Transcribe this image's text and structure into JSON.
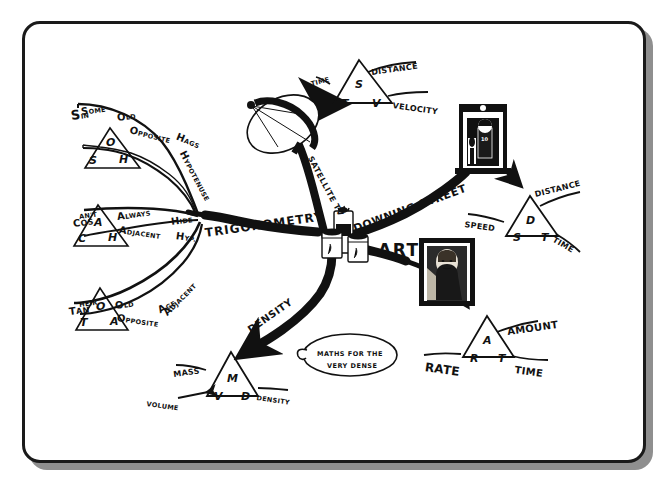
{
  "document": {
    "kind": "hand-drawn-mind-map",
    "title": "Maths Mind Map",
    "frame_color": "#1a1a1a",
    "shadow_color": "#8f8f8f",
    "ink_color": "#111111",
    "paper_color": "#ffffff"
  },
  "center": {
    "label": "ART"
  },
  "branches": {
    "trigonometry": {
      "label": "TRIGONOMETRY"
    },
    "satellite_tv": {
      "label": "SATELLITE TV"
    },
    "downing_street": {
      "label": "DOWNING STREET"
    },
    "density": {
      "label": "DENSITY"
    }
  },
  "mnemonics": [
    {
      "id": "sin",
      "function": "Sin",
      "words": [
        "S",
        "OME",
        "O",
        "LD",
        "O",
        "PPOSITE",
        "H",
        "AGS",
        "H",
        "YPOTENUSE"
      ],
      "phrase_parts": [
        {
          "big": "S",
          "small": "OME"
        },
        {
          "big": "O",
          "small": "LD"
        },
        {
          "big": "O",
          "small": "PPOSITE"
        },
        {
          "big": "H",
          "small": "AGS"
        },
        {
          "big": "H",
          "small": "YPOTENUSE"
        }
      ],
      "func_big": "S",
      "func_small": "IN",
      "triangle": {
        "top": "O",
        "left": "S",
        "right": "H"
      }
    },
    {
      "id": "cos",
      "function": "Cos",
      "phrase_parts": [
        {
          "big": "C",
          "small": "AN'T"
        },
        {
          "big": "A",
          "small": "LWAYS"
        },
        {
          "big": "A",
          "small": "DJACENT"
        },
        {
          "big": "H",
          "small": "IDE"
        },
        {
          "big": "H",
          "small": "YP."
        }
      ],
      "func_big": "C",
      "func_small": "OS",
      "triangle": {
        "top": "A",
        "left": "C",
        "right": "H"
      }
    },
    {
      "id": "tan",
      "function": "Tan",
      "phrase_parts": [
        {
          "big": "T",
          "small": "HEIR"
        },
        {
          "big": "O",
          "small": "LD"
        },
        {
          "big": "O",
          "small": "PPOSITE"
        },
        {
          "big": "A",
          "small": "GE"
        },
        {
          "big": "A",
          "small": "DJACENT"
        }
      ],
      "func_big": "T",
      "func_small": "AN",
      "triangle": {
        "top": "O",
        "left": "T",
        "right": "A"
      }
    }
  ],
  "formula_triangles": [
    {
      "id": "velocity",
      "labels": {
        "top_left": "TIME",
        "top_right": "DISTANCE",
        "right": "VELOCITY"
      },
      "triangle": {
        "top": "S",
        "left": "T",
        "right": "V"
      }
    },
    {
      "id": "speed",
      "labels": {
        "left": "SPEED",
        "top_right": "DISTANCE",
        "bottom_right": "TIME"
      },
      "triangle": {
        "top": "D",
        "left": "S",
        "right": "T"
      }
    },
    {
      "id": "rate",
      "labels": {
        "left": "RATE",
        "top_right": "AMOUNT",
        "bottom_right": "TIME"
      },
      "triangle": {
        "top": "A",
        "left": "R",
        "right": "T"
      }
    },
    {
      "id": "density",
      "labels": {
        "left": "MASS",
        "bottom_left": "VOLUME",
        "right": "DENSITY"
      },
      "triangle": {
        "top": "M",
        "left": "V",
        "right": "D"
      }
    }
  ],
  "speech_bubble": {
    "line1": "MATHS FOR THE",
    "line2": "VERY DENSE"
  },
  "illustrations": [
    {
      "id": "satellite-dish",
      "name": "satellite-dish-illustration"
    },
    {
      "id": "paint-cans",
      "name": "paint-cans-illustration"
    },
    {
      "id": "downing-street-door",
      "name": "downing-street-door-illustration",
      "door_number": "10"
    },
    {
      "id": "mona-lisa",
      "name": "mona-lisa-illustration"
    }
  ]
}
